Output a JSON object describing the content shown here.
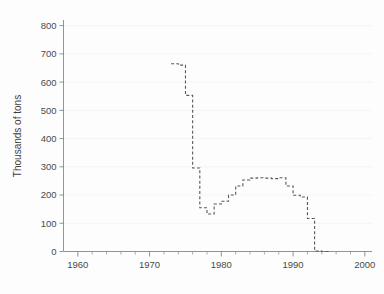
{
  "chart_data": {
    "type": "line",
    "title": "",
    "subtitle": "",
    "xlabel": "",
    "ylabel": "Thousands of tons",
    "xlim": [
      1958,
      2001
    ],
    "ylim": [
      0,
      820
    ],
    "grid": true,
    "legend_position": "none",
    "line_style": "dashed step",
    "line_color": "#585858",
    "background_color": "#fdfdfd",
    "x_ticks": [
      1960,
      1970,
      1980,
      1990,
      2000
    ],
    "x_tick_labels": [
      "1960",
      "1970",
      "1980",
      "1990",
      "2000"
    ],
    "x_minor_tick_step": 2,
    "y_ticks": [
      0,
      100,
      200,
      300,
      400,
      500,
      600,
      700,
      800
    ],
    "y_tick_labels": [
      "0",
      "100",
      "200",
      "300",
      "400",
      "500",
      "600",
      "700",
      "800"
    ],
    "x": [
      1973,
      1974,
      1975,
      1976,
      1977,
      1978,
      1979,
      1980,
      1981,
      1982,
      1983,
      1984,
      1985,
      1986,
      1987,
      1988,
      1989,
      1990,
      1991,
      1992,
      1993,
      1994
    ],
    "values": [
      665,
      660,
      553,
      296,
      155,
      133,
      168,
      178,
      200,
      232,
      253,
      260,
      261,
      260,
      258,
      261,
      232,
      199,
      193,
      117,
      2,
      0
    ],
    "series": [
      {
        "name": "Production",
        "values": [
          665,
          660,
          553,
          296,
          155,
          133,
          168,
          178,
          200,
          232,
          253,
          260,
          261,
          260,
          258,
          261,
          232,
          199,
          193,
          117,
          2,
          0
        ]
      }
    ]
  },
  "figure": {
    "axis_color": "#7a7a7a",
    "grid_color": "#f2f2f2",
    "tick_label_color": "#4a4a4a"
  }
}
